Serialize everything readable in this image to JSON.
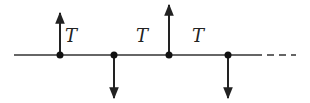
{
  "diagram": {
    "labels": [
      {
        "text": "T",
        "x": 65,
        "y": 24
      },
      {
        "text": "T",
        "x": 136,
        "y": 24
      },
      {
        "text": "T",
        "x": 192,
        "y": 24
      }
    ],
    "line": {
      "y": 55,
      "x_start": 14,
      "x_solid_end": 255,
      "x_dashed_end": 296
    },
    "nodes": [
      {
        "x": 60,
        "direction": "up"
      },
      {
        "x": 114,
        "direction": "down"
      },
      {
        "x": 169,
        "direction": "up"
      },
      {
        "x": 228,
        "direction": "down"
      }
    ],
    "colors": {
      "stroke": "#222222"
    }
  }
}
